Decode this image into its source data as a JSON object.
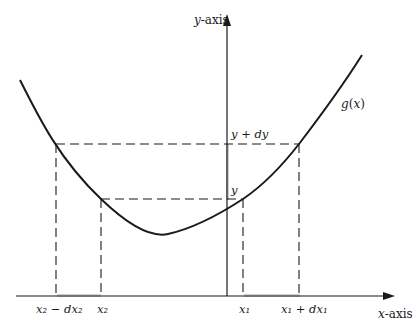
{
  "diagram": {
    "axes": {
      "x_label_var": "x",
      "x_label_suffix": "-axis",
      "y_label_var": "y",
      "y_label_suffix": "-axis"
    },
    "curve": {
      "label_fn": "g",
      "label_arg": "x"
    },
    "y_labels": {
      "y": "y",
      "y_plus_dy": "y + dy"
    },
    "x_labels": {
      "x2_minus_dx2": "x₂ − dx₂",
      "x2": "x₂",
      "x1": "x₁",
      "x1_plus_dx1": "x₁ + dx₁"
    },
    "colors": {
      "ink": "#1a1a1a",
      "highlight": "#c8c8c8"
    }
  }
}
